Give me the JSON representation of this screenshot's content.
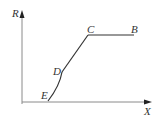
{
  "diagram": {
    "type": "line-graph-sketch",
    "axes": {
      "y_label": "R",
      "x_label": "X"
    },
    "points": [
      {
        "name": "E",
        "label": "E"
      },
      {
        "name": "D",
        "label": "D"
      },
      {
        "name": "C",
        "label": "C"
      },
      {
        "name": "B",
        "label": "B"
      }
    ],
    "colors": {
      "axis": "#8a8a8a",
      "curve": "#333333",
      "text": "#333333"
    }
  }
}
